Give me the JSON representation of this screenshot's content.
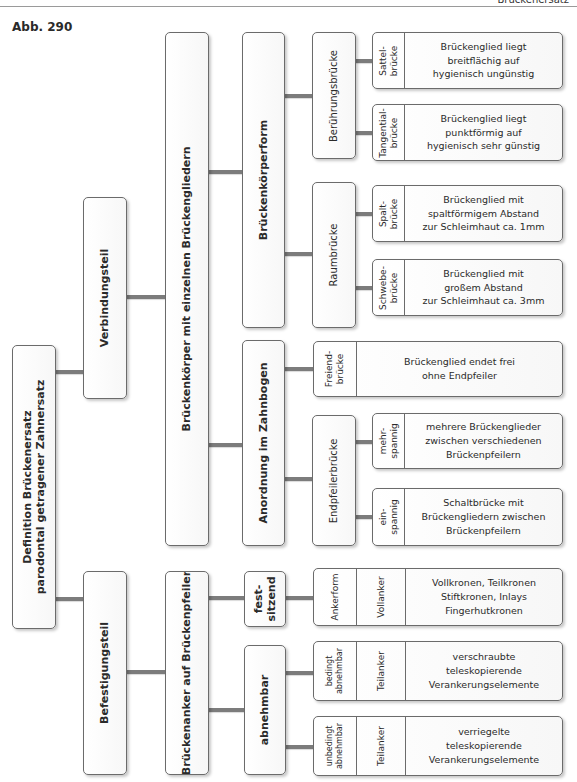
{
  "header": {
    "running_title": "Brückenersatz",
    "figure_label": "Abb. 290"
  },
  "diagram": {
    "root": "Definition Brückenersatz\nparodontal getragener Zahnersatz",
    "level1": {
      "verbindungsteil": "Verbindungsteil",
      "befestigungsteil": "Befestigungsteil"
    },
    "level2": {
      "brueckenkoerper": "Brückenkörper mit einzelnen Brückengliedern",
      "brueckenanker": "Brückenanker auf Brückenpfeiler"
    },
    "level3": {
      "brueckenkoerperform": "Brückenkörperform",
      "anordnung": "Anordnung im Zahnbogen",
      "festsitzend": "fest-\nsitzend",
      "abnehmbar": "abnehmbar"
    },
    "level4": {
      "beruehrungsbruecke": "Berührungsbrücke",
      "raumbruecke": "Raumbrücke",
      "endpfeilerbruecke": "Endpfeilerbrücke"
    },
    "leaves": {
      "sattel": {
        "label": "Sattel-\nbrücke",
        "desc": "Brückenglied liegt\nbreitflächig auf\nhygienisch ungünstig"
      },
      "tangential": {
        "label": "Tangential-\nbrücke",
        "desc": "Brückenglied liegt\npunktförmig auf\nhygienisch sehr günstig"
      },
      "spalt": {
        "label": "Spalt-\nbrücke",
        "desc": "Brückenglied mit\nspaltförmigem Abstand\nzur Schleimhaut ca. 1mm"
      },
      "schwebe": {
        "label": "Schwebe-\nbrücke",
        "desc": "Brückenglied mit\ngroßem Abstand\nzur Schleimhaut ca. 3mm"
      },
      "freiend": {
        "label": "Freiend-\nbrücke",
        "desc": "Brückenglied endet frei\nohne Endpfeiler"
      },
      "mehrspannig": {
        "label": "mehr-\nspannig",
        "desc": "mehrere Brückenglieder\nzwischen verschiedenen\nBrückenpfeilern"
      },
      "einspannig": {
        "label": "ein-\nspannig",
        "desc": "Schaltbrücke mit\nBrückengliedern zwischen\nBrückenpfeilern"
      },
      "ankerform": {
        "label": "Ankerform",
        "sub": "Vollanker",
        "desc": "Vollkronen, Teilkronen\nStiftkronen, Inlays\nFingerhutkronen"
      },
      "bedingt": {
        "label": "bedingt\nabnehmbar",
        "sub": "Teilanker",
        "desc": "verschraubte\nteleskopierende\nVerankerungselemente"
      },
      "unbedingt": {
        "label": "unbedingt\nabnehmbar",
        "sub": "Teilanker",
        "desc": "verriegelte\nteleskopierende\nVerankerungselemente"
      }
    }
  },
  "colors": {
    "border": "#6b6b6b",
    "connector": "#7c7c7c",
    "box_fill": "#f7f7f7"
  }
}
